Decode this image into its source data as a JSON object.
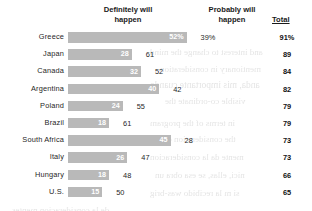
{
  "header": {
    "definitely_label_line1": "Definitely will",
    "definitely_label_line2": "happen",
    "probably_label_line1": "Probably will",
    "probably_label_line2": "happen",
    "total_label": "Total"
  },
  "chart_data": {
    "type": "bar",
    "title": "",
    "xlabel": "",
    "ylabel": "",
    "grid": false,
    "legend_position": "top",
    "xlim": [
      0,
      60
    ],
    "categories": [
      "Greece",
      "Japan",
      "Canada",
      "Argentina",
      "Poland",
      "Brazil",
      "South Africa",
      "Italy",
      "Hungary",
      "U.S."
    ],
    "series": [
      {
        "name": "Definitely will happen",
        "values": [
          52,
          28,
          32,
          40,
          24,
          18,
          45,
          26,
          18,
          15
        ],
        "labels": [
          "52%",
          "28",
          "32",
          "40",
          "24",
          "18",
          "45",
          "26",
          "18",
          "15"
        ]
      },
      {
        "name": "Probably will happen",
        "values": [
          39,
          61,
          52,
          42,
          55,
          61,
          28,
          47,
          48,
          50
        ],
        "labels": [
          "39%",
          "61",
          "52",
          "42",
          "55",
          "61",
          "28",
          "47",
          "48",
          "50"
        ]
      }
    ],
    "totals": [
      "91%",
      "89",
      "84",
      "82",
      "79",
      "79",
      "73",
      "73",
      "66",
      "65"
    ],
    "total_values": [
      91,
      89,
      84,
      82,
      79,
      79,
      73,
      73,
      66,
      65
    ]
  },
  "bleed_text": [
    {
      "t": "and interest to change the mind",
      "x": 150,
      "y": 47,
      "size": 9
    },
    {
      "t": "mentionary in consideration",
      "x": 160,
      "y": 64,
      "size": 9
    },
    {
      "t": "anda, mis importante cuando",
      "x": 150,
      "y": 80,
      "size": 9.5
    },
    {
      "t": "visible co-ordinate the",
      "x": 165,
      "y": 96,
      "size": 9
    },
    {
      "t": "in terms of the program",
      "x": 150,
      "y": 118,
      "size": 9
    },
    {
      "t": "the consideration of a",
      "x": 158,
      "y": 134,
      "size": 9
    },
    {
      "t": "mente da la consideracion",
      "x": 150,
      "y": 152,
      "size": 9
    },
    {
      "t": "nici, ellas, se esa obra un",
      "x": 155,
      "y": 170,
      "size": 9
    },
    {
      "t": "si  m   la recibido was-brig",
      "x": 150,
      "y": 188,
      "size": 9
    },
    {
      "t": "de la consideracion mentes",
      "x": 12,
      "y": 205,
      "size": 9
    }
  ]
}
